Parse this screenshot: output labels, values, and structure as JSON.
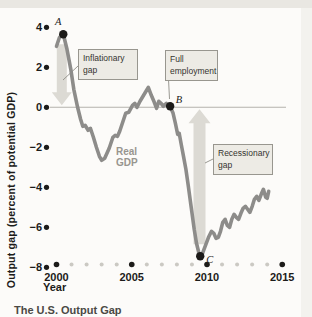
{
  "figure": {
    "caption": "The U.S. Output Gap",
    "colors": {
      "curve": "#8d8c8a",
      "gap_arrow": "#dcdad4",
      "zero_line": "#b4b2ad",
      "axis_dot": "#1c1b19",
      "minor_axis_dot": "#cbc9c3",
      "callout_fill": "#edebe5",
      "callout_border": "#98968f",
      "top_band": "#e9e7e2"
    }
  },
  "chart_data": {
    "type": "line",
    "title": "The U.S. Output Gap",
    "xlabel": "Year",
    "ylabel": "Output gap (percent of potential GDP)",
    "x_range": [
      2000,
      2015
    ],
    "ylim": [
      -8,
      4
    ],
    "y_ticks": [
      4,
      2,
      0,
      -2,
      -4,
      -6,
      -8
    ],
    "x_major_ticks": [
      2000,
      2005,
      2010,
      2015
    ],
    "grid": "zero-line-only",
    "legend_position": "none",
    "series": [
      {
        "name": "Real GDP",
        "points": [
          [
            2000.0,
            3.05
          ],
          [
            2000.2,
            3.5
          ],
          [
            2000.45,
            3.65
          ],
          [
            2000.7,
            2.9
          ],
          [
            2000.95,
            1.9
          ],
          [
            2001.15,
            0.9
          ],
          [
            2001.4,
            0.0
          ],
          [
            2001.6,
            -0.6
          ],
          [
            2001.75,
            -0.95
          ],
          [
            2001.9,
            -0.9
          ],
          [
            2002.1,
            -1.15
          ],
          [
            2002.25,
            -1.05
          ],
          [
            2002.45,
            -1.5
          ],
          [
            2002.65,
            -2.0
          ],
          [
            2002.85,
            -2.45
          ],
          [
            2003.0,
            -2.65
          ],
          [
            2003.2,
            -2.55
          ],
          [
            2003.5,
            -2.05
          ],
          [
            2003.75,
            -1.5
          ],
          [
            2003.9,
            -1.4
          ],
          [
            2004.05,
            -1.45
          ],
          [
            2004.2,
            -1.2
          ],
          [
            2004.4,
            -0.75
          ],
          [
            2004.6,
            -0.3
          ],
          [
            2004.8,
            -0.25
          ],
          [
            2005.05,
            0.1
          ],
          [
            2005.2,
            0.2
          ],
          [
            2005.35,
            0.0
          ],
          [
            2005.55,
            0.3
          ],
          [
            2005.75,
            0.55
          ],
          [
            2005.95,
            0.8
          ],
          [
            2006.1,
            1.0
          ],
          [
            2006.3,
            0.6
          ],
          [
            2006.5,
            0.25
          ],
          [
            2006.65,
            -0.05
          ],
          [
            2006.8,
            0.3
          ],
          [
            2006.95,
            0.2
          ],
          [
            2007.1,
            0.05
          ],
          [
            2007.3,
            0.2
          ],
          [
            2007.55,
            0.05
          ],
          [
            2007.75,
            -0.3
          ],
          [
            2007.9,
            -0.8
          ],
          [
            2008.05,
            -1.35
          ],
          [
            2008.15,
            -1.3
          ],
          [
            2008.3,
            -1.9
          ],
          [
            2008.45,
            -2.5
          ],
          [
            2008.6,
            -3.1
          ],
          [
            2008.75,
            -3.9
          ],
          [
            2008.95,
            -5.0
          ],
          [
            2009.15,
            -6.1
          ],
          [
            2009.3,
            -6.8
          ],
          [
            2009.45,
            -7.25
          ],
          [
            2009.55,
            -7.45
          ],
          [
            2009.7,
            -7.3
          ],
          [
            2009.9,
            -6.9
          ],
          [
            2010.1,
            -6.5
          ],
          [
            2010.3,
            -6.2
          ],
          [
            2010.45,
            -6.3
          ],
          [
            2010.6,
            -6.55
          ],
          [
            2010.75,
            -6.5
          ],
          [
            2010.9,
            -6.2
          ],
          [
            2011.05,
            -5.75
          ],
          [
            2011.2,
            -5.6
          ],
          [
            2011.35,
            -5.9
          ],
          [
            2011.5,
            -6.0
          ],
          [
            2011.65,
            -5.6
          ],
          [
            2011.8,
            -5.35
          ],
          [
            2011.95,
            -5.5
          ],
          [
            2012.1,
            -5.6
          ],
          [
            2012.25,
            -5.3
          ],
          [
            2012.4,
            -5.05
          ],
          [
            2012.55,
            -4.95
          ],
          [
            2012.7,
            -5.1
          ],
          [
            2012.85,
            -5.25
          ],
          [
            2013.0,
            -4.95
          ],
          [
            2013.15,
            -4.6
          ],
          [
            2013.3,
            -4.45
          ],
          [
            2013.45,
            -4.65
          ],
          [
            2013.6,
            -4.35
          ],
          [
            2013.75,
            -4.1
          ],
          [
            2013.9,
            -4.5
          ],
          [
            2014.0,
            -4.55
          ],
          [
            2014.1,
            -4.2
          ]
        ]
      }
    ],
    "curve_label": "Real GDP",
    "markers": [
      {
        "label": "A",
        "year": 2000.45,
        "value": 3.65
      },
      {
        "label": "B",
        "year": 2007.55,
        "value": 0.05
      },
      {
        "label": "C",
        "year": 2009.55,
        "value": -7.45
      }
    ],
    "gap_arrows": [
      {
        "name": "inflationary-gap-arrow",
        "direction": "down",
        "x_year": 2000.35,
        "from_value": 3.15,
        "to_value": 0.1
      },
      {
        "name": "recessionary-gap-arrow",
        "direction": "up",
        "x_year": 2009.5,
        "from_value": -6.85,
        "to_value": -0.1
      }
    ],
    "annotations": [
      {
        "id": "inflationary",
        "label": "Inflationary gap"
      },
      {
        "id": "full-employment",
        "label": "Full employment"
      },
      {
        "id": "recessionary",
        "label": "Recessionary gap"
      }
    ]
  }
}
